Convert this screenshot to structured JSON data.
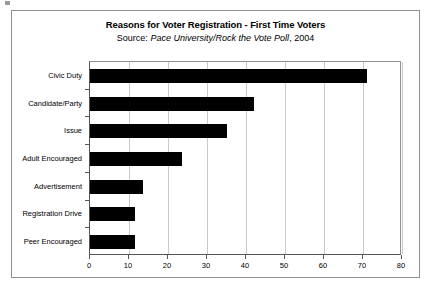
{
  "chart_data": {
    "type": "bar",
    "orientation": "horizontal",
    "title": "Reasons for Voter Registration - First Time Voters",
    "subtitle_prefix": "Source:",
    "subtitle_source": "Pace University/Rock the Vote Poll",
    "subtitle_year": ", 2004",
    "categories": [
      "Civic Duty",
      "Candidate/Party",
      "Issue",
      "Adult Encouraged",
      "Advertisement",
      "Registration Drive",
      "Peer Encouraged"
    ],
    "values": [
      71,
      42,
      35,
      23.5,
      13.5,
      11.5,
      11.5
    ],
    "xlabel": "",
    "ylabel": "",
    "xlim": [
      0,
      80
    ],
    "xticks": [
      0,
      10,
      20,
      30,
      40,
      50,
      60,
      70,
      80
    ],
    "xtick_labels": [
      "0",
      "10",
      "20",
      "30",
      "40",
      "50",
      "60",
      "70",
      "80"
    ],
    "grid": "vertical",
    "legend": "none",
    "bar_color": "#000000",
    "frame_color": "#8f8f8f",
    "gridline_color": "#c9c9c9"
  }
}
